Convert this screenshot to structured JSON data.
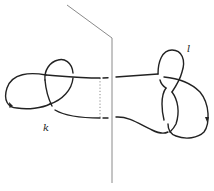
{
  "figure": {
    "type": "knot-diagram",
    "labels": {
      "left_knot": "k",
      "right_knot": "l"
    },
    "colors": {
      "strand": "#222222",
      "plane": "#8a8a8a",
      "background": "#ffffff"
    }
  }
}
